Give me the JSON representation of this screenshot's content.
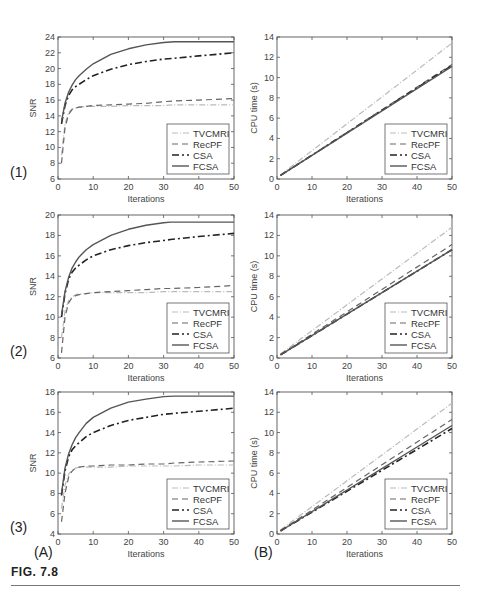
{
  "figure": {
    "label": "FIG. 7.8",
    "column_labels": [
      "(A)",
      "(B)"
    ],
    "row_labels": [
      "(1)",
      "(2)",
      "(3)"
    ]
  },
  "legend": [
    "TVCMRI",
    "RecPF",
    "CSA",
    "FCSA"
  ],
  "styles": {
    "TVCMRI": {
      "color": "#bbbbbb",
      "dash": "6,2,1,2",
      "width": 1.2
    },
    "RecPF": {
      "color": "#666666",
      "dash": "6,4",
      "width": 1.2
    },
    "CSA": {
      "color": "#222222",
      "dash": "7,3,2,3",
      "width": 1.6
    },
    "FCSA": {
      "color": "#555555",
      "dash": "",
      "width": 1.4
    }
  },
  "chart_data": [
    {
      "id": "1A",
      "type": "line",
      "row": "(1)",
      "column": "(A)",
      "xlabel": "Iterations",
      "ylabel": "SNR",
      "xlim": [
        0,
        50
      ],
      "ylim": [
        6,
        24
      ],
      "xticks": [
        0,
        10,
        20,
        30,
        40,
        50
      ],
      "yticks": [
        6,
        8,
        10,
        12,
        14,
        16,
        18,
        20,
        22,
        24
      ],
      "grid": false,
      "legend_position": "lower right",
      "x": [
        1,
        2,
        3,
        4,
        5,
        6,
        8,
        10,
        15,
        20,
        25,
        30,
        33,
        40,
        50
      ],
      "series": [
        {
          "name": "TVCMRI",
          "values": [
            9.0,
            13.0,
            14.4,
            14.9,
            15.0,
            15.1,
            15.2,
            15.2,
            15.2,
            15.3,
            15.3,
            15.3,
            15.4,
            15.4,
            15.4
          ]
        },
        {
          "name": "RecPF",
          "values": [
            8.0,
            12.5,
            14.2,
            14.8,
            15.0,
            15.1,
            15.2,
            15.3,
            15.4,
            15.5,
            15.6,
            15.8,
            15.9,
            16.0,
            16.2
          ]
        },
        {
          "name": "CSA",
          "values": [
            13.0,
            15.3,
            16.6,
            17.3,
            17.7,
            18.0,
            18.6,
            19.1,
            19.9,
            20.5,
            20.9,
            21.2,
            21.3,
            21.6,
            22.0
          ]
        },
        {
          "name": "FCSA",
          "values": [
            13.3,
            15.6,
            17.0,
            17.9,
            18.6,
            19.1,
            19.9,
            20.6,
            21.8,
            22.5,
            23.0,
            23.3,
            23.4,
            23.4,
            23.4
          ]
        }
      ]
    },
    {
      "id": "1B",
      "type": "line",
      "row": "(1)",
      "column": "(B)",
      "xlabel": "Iterations",
      "ylabel": "CPU time (s)",
      "xlim": [
        0,
        50
      ],
      "ylim": [
        0,
        14
      ],
      "xticks": [
        0,
        10,
        20,
        30,
        40,
        50
      ],
      "yticks": [
        0,
        2,
        4,
        6,
        8,
        10,
        12,
        14
      ],
      "grid": false,
      "legend_position": "lower right",
      "x": [
        1,
        50
      ],
      "series": [
        {
          "name": "TVCMRI",
          "values": [
            0.4,
            13.4
          ]
        },
        {
          "name": "RecPF",
          "values": [
            0.35,
            11.3
          ]
        },
        {
          "name": "CSA",
          "values": [
            0.35,
            11.2
          ]
        },
        {
          "name": "FCSA",
          "values": [
            0.35,
            11.1
          ]
        }
      ]
    },
    {
      "id": "2A",
      "type": "line",
      "row": "(2)",
      "column": "(A)",
      "xlabel": "Iterations",
      "ylabel": "SNR",
      "xlim": [
        0,
        50
      ],
      "ylim": [
        6,
        20
      ],
      "xticks": [
        0,
        10,
        20,
        30,
        40,
        50
      ],
      "yticks": [
        6,
        8,
        10,
        12,
        14,
        16,
        18,
        20
      ],
      "grid": false,
      "legend_position": "lower right",
      "x": [
        1,
        2,
        3,
        4,
        5,
        6,
        8,
        10,
        15,
        20,
        25,
        30,
        32,
        40,
        50
      ],
      "series": [
        {
          "name": "TVCMRI",
          "values": [
            8.0,
            10.6,
            11.6,
            12.0,
            12.2,
            12.3,
            12.3,
            12.4,
            12.4,
            12.4,
            12.4,
            12.5,
            12.5,
            12.5,
            12.5
          ]
        },
        {
          "name": "RecPF",
          "values": [
            6.5,
            10.0,
            11.4,
            11.9,
            12.1,
            12.2,
            12.3,
            12.4,
            12.5,
            12.6,
            12.7,
            12.8,
            12.8,
            12.9,
            13.1
          ]
        },
        {
          "name": "CSA",
          "values": [
            10.0,
            12.3,
            13.7,
            14.4,
            14.8,
            15.1,
            15.6,
            16.0,
            16.6,
            17.0,
            17.3,
            17.5,
            17.6,
            17.9,
            18.2
          ]
        },
        {
          "name": "FCSA",
          "values": [
            10.2,
            12.5,
            13.9,
            14.8,
            15.4,
            15.9,
            16.6,
            17.1,
            18.0,
            18.6,
            19.0,
            19.25,
            19.3,
            19.3,
            19.3
          ]
        }
      ]
    },
    {
      "id": "2B",
      "type": "line",
      "row": "(2)",
      "column": "(B)",
      "xlabel": "Iterations",
      "ylabel": "CPU time (s)",
      "xlim": [
        0,
        50
      ],
      "ylim": [
        0,
        14
      ],
      "xticks": [
        0,
        10,
        20,
        30,
        40,
        50
      ],
      "yticks": [
        0,
        2,
        4,
        6,
        8,
        10,
        12,
        14
      ],
      "grid": false,
      "legend_position": "lower right",
      "x": [
        1,
        50
      ],
      "series": [
        {
          "name": "TVCMRI",
          "values": [
            0.4,
            12.8
          ]
        },
        {
          "name": "RecPF",
          "values": [
            0.35,
            11.1
          ]
        },
        {
          "name": "CSA",
          "values": [
            0.3,
            10.6
          ]
        },
        {
          "name": "FCSA",
          "values": [
            0.3,
            10.6
          ]
        }
      ]
    },
    {
      "id": "3A",
      "type": "line",
      "row": "(3)",
      "column": "(A)",
      "xlabel": "Iterations",
      "ylabel": "SNR",
      "xlim": [
        0,
        50
      ],
      "ylim": [
        4,
        18
      ],
      "xticks": [
        0,
        10,
        20,
        30,
        40,
        50
      ],
      "yticks": [
        4,
        6,
        8,
        10,
        12,
        14,
        16,
        18
      ],
      "grid": false,
      "legend_position": "lower right",
      "x": [
        1,
        2,
        3,
        4,
        5,
        6,
        8,
        10,
        15,
        20,
        25,
        30,
        33,
        40,
        50
      ],
      "series": [
        {
          "name": "TVCMRI",
          "values": [
            6.5,
            8.8,
            9.9,
            10.3,
            10.5,
            10.6,
            10.6,
            10.6,
            10.6,
            10.7,
            10.7,
            10.7,
            10.7,
            10.8,
            10.8
          ]
        },
        {
          "name": "RecPF",
          "values": [
            5.2,
            8.0,
            9.6,
            10.2,
            10.5,
            10.6,
            10.7,
            10.7,
            10.8,
            10.8,
            10.9,
            10.9,
            11.0,
            11.1,
            11.2
          ]
        },
        {
          "name": "CSA",
          "values": [
            7.8,
            10.2,
            11.6,
            12.3,
            12.7,
            13.0,
            13.6,
            14.0,
            14.7,
            15.2,
            15.5,
            15.8,
            15.9,
            16.1,
            16.4
          ]
        },
        {
          "name": "FCSA",
          "values": [
            8.0,
            10.5,
            11.9,
            12.8,
            13.5,
            14.0,
            14.9,
            15.5,
            16.4,
            17.0,
            17.3,
            17.55,
            17.6,
            17.6,
            17.6
          ]
        }
      ]
    },
    {
      "id": "3B",
      "type": "line",
      "row": "(3)",
      "column": "(B)",
      "xlabel": "Iterations",
      "ylabel": "CPU time (s)",
      "xlim": [
        0,
        50
      ],
      "ylim": [
        0,
        14
      ],
      "xticks": [
        0,
        10,
        20,
        30,
        40,
        50
      ],
      "yticks": [
        0,
        2,
        4,
        6,
        8,
        10,
        12,
        14
      ],
      "grid": false,
      "legend_position": "lower right",
      "x": [
        1,
        50
      ],
      "series": [
        {
          "name": "TVCMRI",
          "values": [
            0.4,
            12.9
          ]
        },
        {
          "name": "RecPF",
          "values": [
            0.35,
            11.3
          ]
        },
        {
          "name": "CSA",
          "values": [
            0.3,
            10.4
          ]
        },
        {
          "name": "FCSA",
          "values": [
            0.3,
            10.7
          ]
        }
      ]
    }
  ]
}
